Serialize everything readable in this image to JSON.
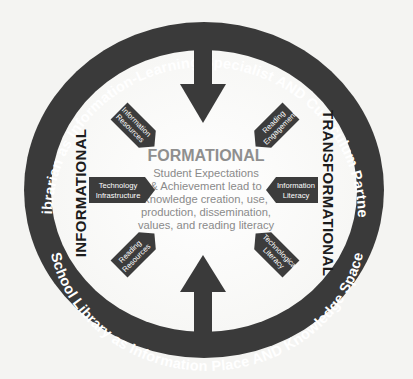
{
  "diagram": {
    "outer_ring": {
      "top_label": "School Librarian as Information-Learning Specialist AND Curriculum Partner-Leader",
      "bottom_label": "School Library as Information Place AND Knowledge Space"
    },
    "left_label": "INFORMATIONAL",
    "right_label": "TRANSFORMATIONAL",
    "center": {
      "title": "FORMATIONAL",
      "lines": [
        "Student Expectations",
        "& Achievement lead to",
        "knowledge creation, use,",
        "production, dissemination,",
        "values, and reading literacy"
      ]
    },
    "nodes": [
      {
        "id": "information-resources",
        "lines": [
          "Information",
          "Resources"
        ]
      },
      {
        "id": "reading-engagement",
        "lines": [
          "Reading",
          "Engagement"
        ]
      },
      {
        "id": "technology-infrastructure",
        "lines": [
          "Technology",
          "Infrastructure"
        ]
      },
      {
        "id": "information-literacy",
        "lines": [
          "Information",
          "Literacy"
        ]
      },
      {
        "id": "reading-resources",
        "lines": [
          "Reading",
          "Resources"
        ]
      },
      {
        "id": "technological-literacy",
        "lines": [
          "Technological",
          "Literacy"
        ]
      }
    ],
    "arrows": [
      {
        "id": "top-arrow",
        "direction": "down"
      },
      {
        "id": "bottom-arrow",
        "direction": "up"
      }
    ],
    "colors": {
      "ring": "#3a3a3a",
      "node": "#3c3c3c",
      "center_text": "#8a8a8a",
      "background": "#f4f4f2"
    }
  }
}
